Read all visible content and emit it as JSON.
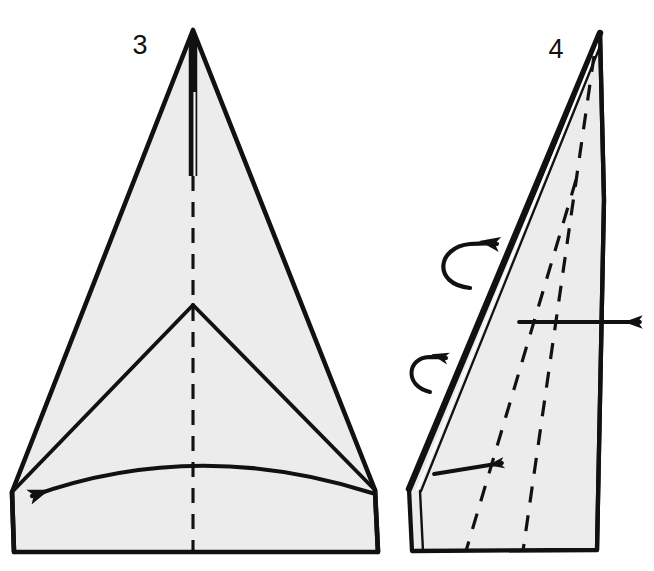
{
  "page": {
    "background_color": "#ffffff",
    "paper_fill_color": "#ececec",
    "line_color": "#111111",
    "width": 654,
    "height": 571
  },
  "steps": [
    {
      "id": "step-3",
      "number": "3",
      "label_position": {
        "x": 140,
        "y": 54
      },
      "shape": "tall symmetric kite with vertical center crease and two diagonal creases meeting at a V junction",
      "apex": {
        "x": 193,
        "y": 30
      },
      "bottom_left": {
        "x": 12,
        "y": 492
      },
      "bottom_right": {
        "x": 375,
        "y": 490
      },
      "base_left": {
        "x": 14,
        "y": 552
      },
      "base_right": {
        "x": 378,
        "y": 552
      },
      "v_junction": {
        "x": 193,
        "y": 305
      },
      "center_slot": {
        "top_y": 36,
        "bottom_y": 176
      },
      "creases": [
        {
          "type": "valley-dashed",
          "from": {
            "x": 193,
            "y": 40
          },
          "to": {
            "x": 193,
            "y": 552
          }
        },
        {
          "type": "fold-solid",
          "from": {
            "x": 193,
            "y": 305
          },
          "to": {
            "x": 12,
            "y": 492
          }
        },
        {
          "type": "fold-solid",
          "from": {
            "x": 193,
            "y": 305
          },
          "to": {
            "x": 375,
            "y": 490
          }
        }
      ],
      "arrows": [
        {
          "name": "fold-left-arrow",
          "kind": "curved",
          "direction": "right-to-left",
          "from": {
            "x": 372,
            "y": 493
          },
          "apex": {
            "x": 196,
            "y": 455
          },
          "to": {
            "x": 30,
            "y": 497
          }
        }
      ]
    },
    {
      "id": "step-4",
      "number": "4",
      "label_position": {
        "x": 556,
        "y": 58
      },
      "shape": "narrow folded triangle with layered left edge and two slanted valley creases",
      "apex": {
        "x": 600,
        "y": 33
      },
      "right_bottom": {
        "x": 597,
        "y": 550
      },
      "left_kink": {
        "x": 409,
        "y": 489
      },
      "left_bottom": {
        "x": 412,
        "y": 551
      },
      "creases": [
        {
          "type": "valley-dashed",
          "from": {
            "x": 594,
            "y": 56
          },
          "to": {
            "x": 523,
            "y": 551
          }
        },
        {
          "type": "valley-dashed",
          "from": {
            "x": 576,
            "y": 180
          },
          "to": {
            "x": 466,
            "y": 551
          }
        }
      ],
      "arrows": [
        {
          "name": "curl-arrow-upper",
          "kind": "curl",
          "direction": "counterclockwise-up-right",
          "tail": {
            "x": 452,
            "y": 285
          },
          "head": {
            "x": 498,
            "y": 242
          }
        },
        {
          "name": "curl-arrow-lower",
          "kind": "curl",
          "direction": "counterclockwise-up-right",
          "tail": {
            "x": 419,
            "y": 392
          },
          "head": {
            "x": 447,
            "y": 357
          }
        },
        {
          "name": "unfold-right-arrow",
          "kind": "straight",
          "direction": "rightward",
          "from": {
            "x": 519,
            "y": 322
          },
          "to": {
            "x": 646,
            "y": 322
          }
        },
        {
          "name": "fold-right-arrow-lower",
          "kind": "straight",
          "direction": "rightward",
          "from": {
            "x": 434,
            "y": 474
          },
          "to": {
            "x": 508,
            "y": 462
          }
        }
      ]
    }
  ]
}
